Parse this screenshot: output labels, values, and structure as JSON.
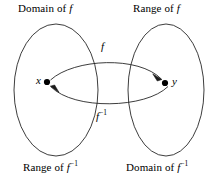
{
  "figure": {
    "background_color": "#ffffff",
    "stroke_color": "#1a1a1a",
    "width": 216,
    "height": 181
  },
  "labels": {
    "top_left": "Domain of",
    "top_right": "Range of",
    "bottom_left": "Range of",
    "bottom_right": "Domain of",
    "f_symbol": "f",
    "f_inverse_exponent": "−1"
  },
  "elements": {
    "point_x": "x",
    "point_y": "y",
    "arrow_forward": "f",
    "arrow_inverse": "f"
  },
  "ellipses": {
    "left": {
      "cx": 56,
      "cy": 90,
      "rx": 42,
      "ry": 66
    },
    "right": {
      "cx": 166,
      "cy": 90,
      "rx": 38,
      "ry": 66
    }
  },
  "points": {
    "x": {
      "cx": 47,
      "cy": 82,
      "r": 3.1
    },
    "y": {
      "cx": 165,
      "cy": 83,
      "r": 3.1
    }
  }
}
